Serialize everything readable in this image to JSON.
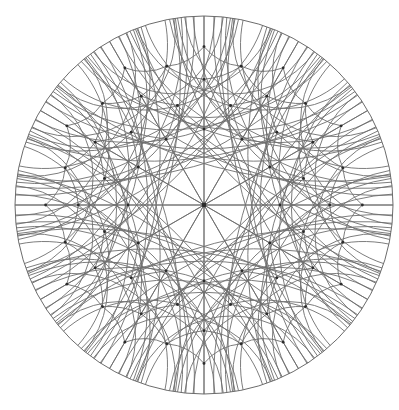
{
  "figure": {
    "kind": "geometric-diagram",
    "background_color": "#ffffff"
  },
  "chart_data": {
    "type": "diagram",
    "model": "poincare-disk",
    "canvas": {
      "width": 399,
      "height": 410
    },
    "disk": {
      "center_x": 204,
      "center_y": 205,
      "radius": 189,
      "boundary_stroke": "#6b6b6b",
      "boundary_stroke_width": 1.0
    },
    "style": {
      "line_color": "#6e6e6e",
      "line_width": 0.9,
      "vertex_color": "#2b2b2b",
      "vertex_size": 2.0
    },
    "symmetry": {
      "type": "dihedral",
      "order": 12,
      "center_vertex_degree": 12,
      "description": "12 diameters through the disk center plus families of circular geodesic arcs orthogonal to the boundary"
    },
    "generators": {
      "diameters_count": 12,
      "diameter_angles_deg": [
        0,
        15,
        30,
        45,
        60,
        75,
        90,
        105,
        120,
        135,
        150,
        165
      ],
      "arc_families": [
        {
          "name": "ring-1",
          "vertex_radius_frac": 0.402,
          "count": 12,
          "note": "geodesics bounding the central 12-gon region"
        },
        {
          "name": "ring-2",
          "vertex_radius_frac": 0.545,
          "count": 12
        },
        {
          "name": "ring-3",
          "vertex_radius_frac": 0.665,
          "count": 24
        },
        {
          "name": "ring-4",
          "vertex_radius_frac": 0.76,
          "count": 24
        },
        {
          "name": "ring-5",
          "vertex_radius_frac": 0.838,
          "count": 24
        }
      ]
    },
    "measured_vertices": [
      {
        "label": "center",
        "x": 204,
        "y": 205,
        "degree": 12
      },
      {
        "label": "ring1-left",
        "x": 128,
        "y": 207,
        "degree": 8
      },
      {
        "label": "ring1-up",
        "x": 202,
        "y": 102,
        "degree": 6
      },
      {
        "label": "ring2-ne",
        "x": 238,
        "y": 142,
        "degree": 10
      },
      {
        "label": "ring2-nw",
        "x": 162,
        "y": 134,
        "degree": 10
      },
      {
        "label": "ring3-nw",
        "x": 127,
        "y": 75,
        "degree": 8
      },
      {
        "label": "ring3-ne",
        "x": 272,
        "y": 73,
        "degree": 8
      },
      {
        "label": "ring4-w",
        "x": 58,
        "y": 205,
        "degree": 8
      }
    ],
    "xlabel": "",
    "ylabel": "",
    "grid": false,
    "legend": null
  }
}
